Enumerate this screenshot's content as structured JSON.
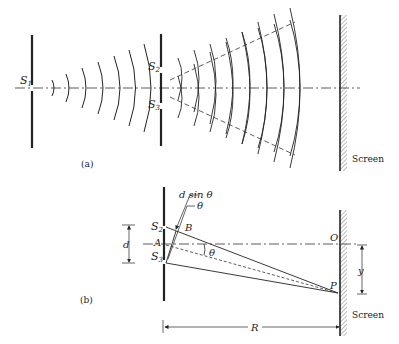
{
  "figure_a": {
    "caption": "(a)",
    "labels": {
      "s1": "S",
      "s1_sub": "1",
      "s2": "S",
      "s2_sub": "2",
      "s3": "S",
      "s3_sub": "3",
      "screen": "Screen"
    }
  },
  "figure_b": {
    "caption": "(b)",
    "labels": {
      "s2": "S",
      "s2_sub": "2",
      "s3": "S",
      "s3_sub": "3",
      "d_sin_theta": "d sin θ",
      "theta_top": "θ",
      "theta_angle": "θ",
      "b": "B",
      "a": "A",
      "d": "d",
      "o": "O",
      "p": "P",
      "y": "y",
      "r": "R",
      "screen": "Screen"
    }
  },
  "colors": {
    "ink": "#222222",
    "background": "#ffffff"
  }
}
